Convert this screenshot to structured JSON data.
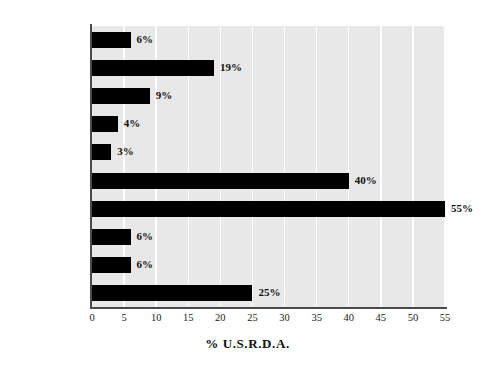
{
  "chart_data": {
    "type": "bar",
    "orientation": "horizontal",
    "title": "",
    "xlabel": "% U.S.R.D.A.",
    "ylabel": "",
    "xlim": [
      0,
      55
    ],
    "xticks": [
      0,
      5,
      10,
      15,
      20,
      25,
      30,
      35,
      40,
      45,
      50,
      55
    ],
    "xtick_labels": [
      "0",
      "5",
      "10",
      "15",
      "20",
      "25",
      "30",
      "35",
      "40",
      "45",
      "50",
      "55"
    ],
    "grid": "vertical-white-gridlines",
    "legend": "none",
    "categories": [
      "CALORIES",
      "PROTEIN",
      "IRON",
      "ZINC",
      "CALCIUM",
      "VITAMIN A",
      "VITAMIN C",
      "THIAMIN",
      "RIBOFLAVIN",
      "NIACIN"
    ],
    "values": [
      6,
      19,
      9,
      4,
      3,
      40,
      55,
      6,
      6,
      25
    ],
    "data_labels": [
      "6%",
      "19%",
      "9%",
      "4%",
      "3%",
      "40%",
      "55%",
      "6%",
      "6%",
      "25%"
    ],
    "bar_color": "#000000",
    "plot_background": "#e8e8e8",
    "gridline_color": "#fdfdfd",
    "axis_color": "#4a4a4a"
  }
}
